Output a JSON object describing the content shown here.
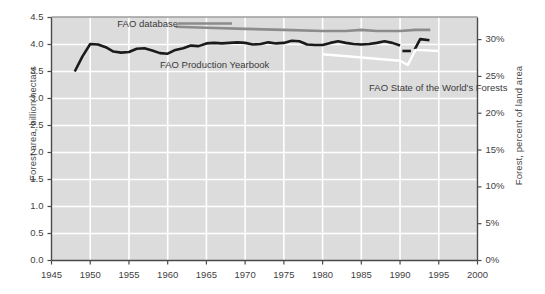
{
  "chart_data": {
    "type": "line",
    "title": "",
    "xlabel": "",
    "ylabel": "Forest area, billion hectars",
    "ylabel_right": "Forest, percent of land area",
    "xlim": [
      1945,
      2000
    ],
    "ylim": [
      0.0,
      4.5
    ],
    "ylim_right": [
      0,
      33.0
    ],
    "grid": true,
    "legend_position": "inline-annotations",
    "background_color": "#dcdcdc",
    "gridline_color": "#ffffff",
    "xticks": [
      1945,
      1950,
      1955,
      1960,
      1965,
      1970,
      1975,
      1980,
      1985,
      1990,
      1995,
      2000
    ],
    "xticklabels": [
      "1945",
      "1950",
      "1955",
      "1960",
      "1965",
      "1970",
      "1975",
      "1980",
      "1985",
      "1990",
      "1995",
      "2000"
    ],
    "yticks": [
      0.0,
      0.5,
      1.0,
      1.5,
      2.0,
      2.5,
      3.0,
      3.5,
      4.0,
      4.5
    ],
    "yticklabels": [
      "0.0",
      "0.5",
      "1.0",
      "1.5",
      "2.0",
      "2.5",
      "3.0",
      "3.5",
      "4.0",
      "4.5"
    ],
    "yticks_right": [
      0,
      5,
      10,
      15,
      20,
      25,
      30
    ],
    "yticklabels_right": [
      "0%",
      "5%",
      "10%",
      "15%",
      "20%",
      "25%",
      "30%"
    ],
    "series": [
      {
        "name": "FAO Production Yearbook",
        "color": "#1a1a1a",
        "width": 2.6,
        "label_x": 1959.0,
        "label_y": 3.6,
        "points": [
          [
            1948,
            3.5
          ],
          [
            1949,
            3.78
          ],
          [
            1950,
            4.01
          ],
          [
            1951,
            4.0
          ],
          [
            1952,
            3.95
          ],
          [
            1953,
            3.87
          ],
          [
            1954,
            3.85
          ],
          [
            1955,
            3.86
          ],
          [
            1956,
            3.92
          ],
          [
            1957,
            3.93
          ],
          [
            1958,
            3.89
          ],
          [
            1959,
            3.84
          ],
          [
            1960,
            3.83
          ],
          [
            1961,
            3.9
          ],
          [
            1962,
            3.93
          ],
          [
            1963,
            3.98
          ],
          [
            1964,
            3.97
          ],
          [
            1965,
            4.02
          ],
          [
            1966,
            4.03
          ],
          [
            1967,
            4.02
          ],
          [
            1968,
            4.03
          ],
          [
            1969,
            4.04
          ],
          [
            1970,
            4.03
          ],
          [
            1971,
            4.0
          ],
          [
            1972,
            4.01
          ],
          [
            1973,
            4.04
          ],
          [
            1974,
            4.02
          ],
          [
            1975,
            4.03
          ],
          [
            1976,
            4.07
          ],
          [
            1977,
            4.06
          ],
          [
            1978,
            4.0
          ],
          [
            1979,
            3.99
          ],
          [
            1980,
            3.99
          ],
          [
            1981,
            4.03
          ],
          [
            1982,
            4.06
          ],
          [
            1983,
            4.03
          ],
          [
            1984,
            4.01
          ],
          [
            1985,
            4.0
          ],
          [
            1986,
            4.01
          ],
          [
            1987,
            4.03
          ],
          [
            1988,
            4.06
          ],
          [
            1989,
            4.03
          ],
          [
            1990,
            3.98
          ]
        ]
      },
      {
        "name": "FAO Production Yearbook segment 2",
        "color": "#1a1a1a",
        "width": 2.6,
        "points": [
          [
            1990.3,
            3.88
          ],
          [
            1991.4,
            3.88
          ]
        ]
      },
      {
        "name": "FAO Production Yearbook segment 3",
        "color": "#1a1a1a",
        "width": 2.6,
        "points": [
          [
            1991.9,
            3.91
          ],
          [
            1992.6,
            4.1
          ],
          [
            1993.8,
            4.08
          ]
        ]
      },
      {
        "name": "FAO database",
        "color": "#8c8c8c",
        "width": 2.6,
        "label_x": 1953.5,
        "label_y": 4.36,
        "points": [
          [
            1961,
            4.33
          ],
          [
            1965,
            4.31
          ],
          [
            1970,
            4.29
          ],
          [
            1975,
            4.27
          ],
          [
            1980,
            4.25
          ],
          [
            1983,
            4.25
          ],
          [
            1985,
            4.27
          ],
          [
            1987,
            4.25
          ],
          [
            1990,
            4.25
          ],
          [
            1992,
            4.27
          ],
          [
            1993.9,
            4.27
          ]
        ]
      },
      {
        "name": "FAO State of the World's Forests",
        "color": "#ffffff",
        "width": 2.4,
        "label_x": 1986.0,
        "label_y": 3.18,
        "points": [
          [
            1980,
            3.82
          ],
          [
            1985,
            3.76
          ],
          [
            1990,
            3.7
          ],
          [
            1991,
            3.62
          ],
          [
            1992,
            3.9
          ],
          [
            1995,
            3.88
          ]
        ]
      }
    ]
  }
}
